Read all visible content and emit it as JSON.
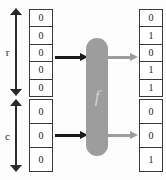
{
  "diagram": {
    "function_label": "f",
    "colors": {
      "background": "#fdfdfd",
      "cell_border": "#3a3a3a",
      "text": "#1c1c1c",
      "function_box": "#9d9d9d",
      "function_glyph": "#d3d3d3",
      "input_arrow": "#1a1a1a",
      "output_arrow": "#9d9d9d",
      "measure_arrow": "#2b2b2b"
    },
    "measures": [
      {
        "label": "r",
        "span_cells": 5,
        "group": "top"
      },
      {
        "label": "c",
        "span_cells": 3,
        "group": "bottom"
      }
    ],
    "input_vector": {
      "name": "input-bit-vector",
      "groups": [
        {
          "name": "r",
          "bits": [
            "0",
            "0",
            "0",
            "0",
            "0"
          ]
        },
        {
          "name": "c",
          "bits": [
            "0",
            "0",
            "0"
          ]
        }
      ]
    },
    "output_vector": {
      "name": "output-bit-vector",
      "groups": [
        {
          "name": "r",
          "bits": [
            "0",
            "1",
            "0",
            "1",
            "1"
          ]
        },
        {
          "name": "c",
          "bits": [
            "0",
            "0",
            "1"
          ]
        }
      ]
    },
    "signals": {
      "inputs": [
        {
          "name": "input-arrow-top",
          "style": "dark"
        },
        {
          "name": "input-arrow-bottom",
          "style": "dark"
        }
      ],
      "outputs": [
        {
          "name": "output-arrow-top",
          "style": "light"
        },
        {
          "name": "output-arrow-bottom",
          "style": "light"
        }
      ]
    }
  }
}
